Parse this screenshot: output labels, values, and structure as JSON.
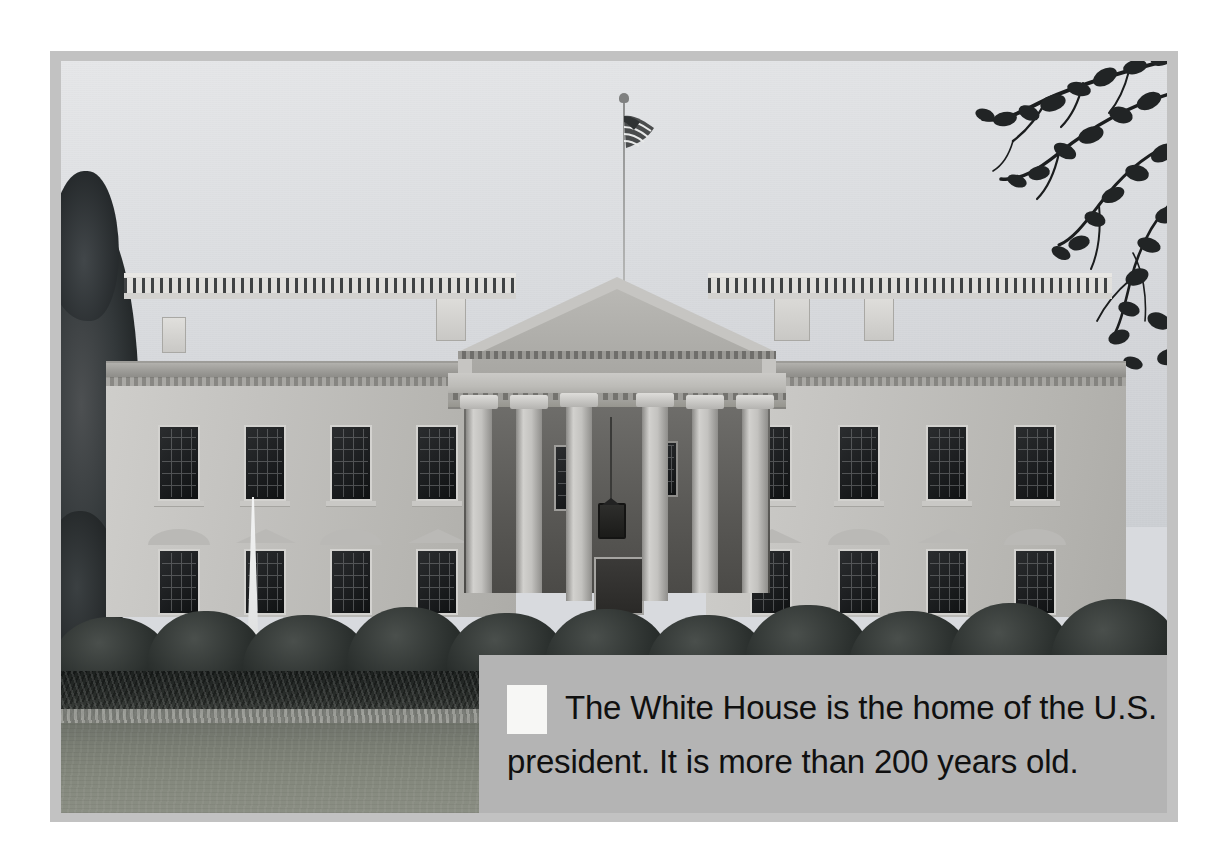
{
  "page": {
    "background_color": "#ffffff",
    "frame_color": "#c2c2c2"
  },
  "photo": {
    "subject": "The White House north facade",
    "treatment": "black-and-white photograph",
    "sky": {
      "name": "sky",
      "color": "#dcdee1"
    },
    "left_tree": {
      "name": "conifer-tree",
      "color": "#2a2f31"
    },
    "right_branches": {
      "name": "dogwood-branch",
      "color": "#1b1d1e"
    },
    "flag": {
      "name": "american-flag",
      "color": "#3a3a38"
    },
    "building": {
      "name": "white-house-building",
      "wall_color": "#c3c2bf",
      "portico": {
        "name": "north-portico",
        "columns": 6
      },
      "balustrade": {
        "name": "roof-balustrade"
      },
      "chimneys": 4
    },
    "fountain": {
      "name": "fountain",
      "color": "#eceded"
    },
    "hedges": {
      "name": "hedge-row",
      "color": "#242926"
    },
    "flowerbed": {
      "name": "flower-bed",
      "color": "#333733"
    },
    "lawn": {
      "name": "lawn",
      "color": "#83877c"
    }
  },
  "caption": {
    "background_color": "#b4b4b4",
    "text_color": "#101010",
    "marker": {
      "name": "white-square-marker",
      "color": "#f7f7f5"
    },
    "lines": [
      "The White House is the home of the U.S.",
      "president. It is more than 200 years old."
    ],
    "full_text": "The White House is the home of the U.S. president. It is more than 200 years old."
  }
}
